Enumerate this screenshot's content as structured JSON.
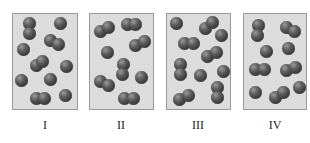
{
  "diagram": {
    "sphere_color": "#4a4a4a",
    "box_fill": "#dcdcdc",
    "box_border": "#9a9a9a",
    "boxes": [
      {
        "label": "I",
        "rect": [
          12,
          13,
          66,
          97
        ],
        "spheres": [
          [
            29,
            23
          ],
          [
            29,
            33
          ],
          [
            60,
            23
          ],
          [
            50,
            40
          ],
          [
            58,
            44
          ],
          [
            23,
            49
          ],
          [
            36,
            65
          ],
          [
            42,
            61
          ],
          [
            66,
            66
          ],
          [
            21,
            80
          ],
          [
            50,
            79
          ],
          [
            36,
            98
          ],
          [
            44,
            98
          ],
          [
            65,
            95
          ]
        ]
      },
      {
        "label": "II",
        "rect": [
          89,
          13,
          65,
          97
        ],
        "spheres": [
          [
            100,
            31
          ],
          [
            108,
            27
          ],
          [
            127,
            24
          ],
          [
            135,
            24
          ],
          [
            135,
            45
          ],
          [
            144,
            41
          ],
          [
            107,
            52
          ],
          [
            123,
            64
          ],
          [
            122,
            74
          ],
          [
            100,
            81
          ],
          [
            108,
            85
          ],
          [
            141,
            77
          ],
          [
            124,
            98
          ],
          [
            133,
            98
          ]
        ]
      },
      {
        "label": "III",
        "rect": [
          166,
          13,
          65,
          97
        ],
        "spheres": [
          [
            176,
            23
          ],
          [
            205,
            28
          ],
          [
            212,
            22
          ],
          [
            221,
            35
          ],
          [
            184,
            43
          ],
          [
            193,
            43
          ],
          [
            207,
            56
          ],
          [
            216,
            52
          ],
          [
            180,
            64
          ],
          [
            180,
            74
          ],
          [
            200,
            75
          ],
          [
            223,
            71
          ],
          [
            179,
            99
          ],
          [
            188,
            95
          ],
          [
            217,
            87
          ],
          [
            217,
            97
          ]
        ]
      },
      {
        "label": "IV",
        "rect": [
          243,
          13,
          64,
          97
        ],
        "spheres": [
          [
            258,
            25
          ],
          [
            257,
            35
          ],
          [
            286,
            27
          ],
          [
            294,
            31
          ],
          [
            266,
            51
          ],
          [
            288,
            48
          ],
          [
            255,
            69
          ],
          [
            264,
            69
          ],
          [
            286,
            70
          ],
          [
            295,
            67
          ],
          [
            255,
            92
          ],
          [
            275,
            97
          ],
          [
            283,
            92
          ],
          [
            299,
            87
          ]
        ]
      }
    ]
  }
}
